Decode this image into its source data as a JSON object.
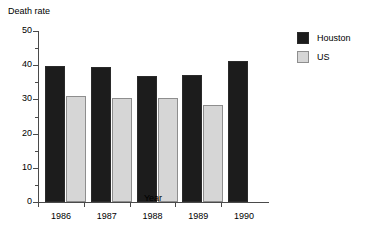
{
  "chart_data": {
    "type": "bar",
    "title": "",
    "ylabel": "Death rate",
    "xlabel": "Year",
    "categories": [
      "1986",
      "1987",
      "1988",
      "1989",
      "1990"
    ],
    "ylim": [
      0,
      50
    ],
    "yticks": [
      "0",
      "10",
      "20",
      "30",
      "40",
      "50"
    ],
    "grid": false,
    "legend_position": "right",
    "series": [
      {
        "name": "Houston",
        "color": "#1c1c1c",
        "values": [
          39.8,
          39.5,
          36.9,
          37.1,
          41.3
        ]
      },
      {
        "name": "US",
        "color": "#d6d6d6",
        "values": [
          31.0,
          30.5,
          30.3,
          28.5,
          null
        ]
      }
    ]
  },
  "legend": {
    "items": [
      {
        "label": "Houston",
        "swatch": "houston-swatch"
      },
      {
        "label": "US",
        "swatch": "us-swatch"
      }
    ]
  }
}
